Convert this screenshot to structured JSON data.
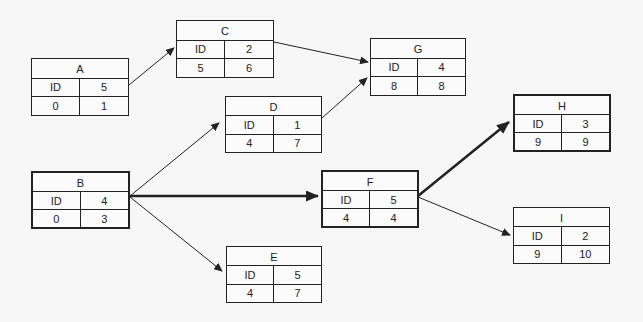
{
  "diagram": {
    "type": "network-activity-diagram",
    "colors": {
      "line": "#222222",
      "background": "#f7f7f7"
    },
    "nodes": [
      {
        "id": "A",
        "label": "A",
        "id_label": "ID",
        "duration": "5",
        "es": "0",
        "ef": "1",
        "critical": false,
        "x": 31,
        "y": 58,
        "w": 98,
        "h": 58
      },
      {
        "id": "B",
        "label": "B",
        "id_label": "ID",
        "duration": "4",
        "es": "0",
        "ef": "3",
        "critical": true,
        "x": 31,
        "y": 171,
        "w": 99,
        "h": 58
      },
      {
        "id": "C",
        "label": "C",
        "id_label": "ID",
        "duration": "2",
        "es": "5",
        "ef": "6",
        "critical": false,
        "x": 176,
        "y": 20,
        "w": 98,
        "h": 58
      },
      {
        "id": "D",
        "label": "D",
        "id_label": "ID",
        "duration": "1",
        "es": "4",
        "ef": "7",
        "critical": false,
        "x": 225,
        "y": 96,
        "w": 97,
        "h": 57
      },
      {
        "id": "E",
        "label": "E",
        "id_label": "ID",
        "duration": "5",
        "es": "4",
        "ef": "7",
        "critical": false,
        "x": 226,
        "y": 246,
        "w": 96,
        "h": 57
      },
      {
        "id": "F",
        "label": "F",
        "id_label": "ID",
        "duration": "5",
        "es": "4",
        "ef": "4",
        "critical": true,
        "x": 321,
        "y": 170,
        "w": 98,
        "h": 58
      },
      {
        "id": "G",
        "label": "G",
        "id_label": "ID",
        "duration": "4",
        "es": "8",
        "ef": "8",
        "critical": false,
        "x": 370,
        "y": 38,
        "w": 96,
        "h": 58
      },
      {
        "id": "H",
        "label": "H",
        "id_label": "ID",
        "duration": "3",
        "es": "9",
        "ef": "9",
        "critical": true,
        "x": 513,
        "y": 94,
        "w": 98,
        "h": 58
      },
      {
        "id": "I",
        "label": "I",
        "id_label": "ID",
        "duration": "2",
        "es": "9",
        "ef": "10",
        "critical": false,
        "x": 513,
        "y": 207,
        "w": 97,
        "h": 57
      }
    ],
    "edges": [
      {
        "from": "A",
        "to": "C",
        "critical": false,
        "x1": 129,
        "y1": 85,
        "x2": 174,
        "y2": 48
      },
      {
        "from": "C",
        "to": "G",
        "critical": false,
        "x1": 274,
        "y1": 42,
        "x2": 368,
        "y2": 62
      },
      {
        "from": "D",
        "to": "G",
        "critical": false,
        "x1": 322,
        "y1": 118,
        "x2": 367,
        "y2": 78
      },
      {
        "from": "B",
        "to": "D",
        "critical": false,
        "x1": 130,
        "y1": 196,
        "x2": 219,
        "y2": 123
      },
      {
        "from": "B",
        "to": "F",
        "critical": true,
        "x1": 130,
        "y1": 196,
        "x2": 318,
        "y2": 196
      },
      {
        "from": "B",
        "to": "E",
        "critical": false,
        "x1": 130,
        "y1": 197,
        "x2": 222,
        "y2": 271
      },
      {
        "from": "F",
        "to": "H",
        "critical": true,
        "x1": 418,
        "y1": 196,
        "x2": 509,
        "y2": 122
      },
      {
        "from": "F",
        "to": "I",
        "critical": false,
        "x1": 418,
        "y1": 197,
        "x2": 510,
        "y2": 235
      }
    ]
  }
}
